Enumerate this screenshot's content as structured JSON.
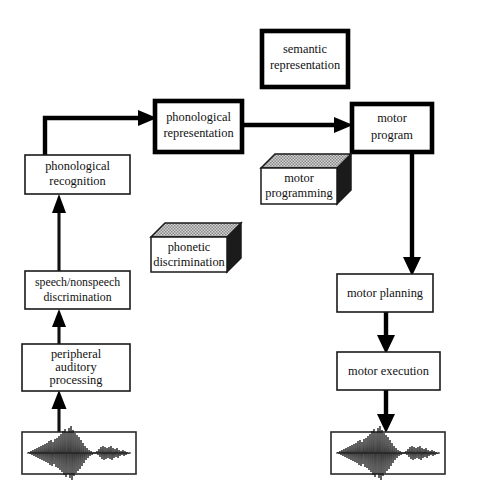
{
  "diagram": {
    "background_color": "#ffffff",
    "line_color": "#000000",
    "box_fill": "#ffffff",
    "cube_side_color": "#1b1b1b",
    "cube_top_color": "#c9c9c9",
    "nodes": [
      {
        "id": "semantic-representation",
        "label_lines": [
          "semantic",
          "representation"
        ],
        "style": "thick-bordered-box",
        "x": 262,
        "y": 31,
        "w": 86,
        "h": 56
      },
      {
        "id": "phonological-representation",
        "label_lines": [
          "phonological",
          "representation"
        ],
        "style": "thick-bordered-box",
        "x": 155,
        "y": 101,
        "w": 87,
        "h": 51
      },
      {
        "id": "motor-program",
        "label_lines": [
          "motor",
          "program"
        ],
        "style": "thick-bordered-box",
        "x": 352,
        "y": 104,
        "w": 80,
        "h": 48
      },
      {
        "id": "phonological-recognition",
        "label_lines": [
          "phonological",
          "recognition"
        ],
        "style": "plain-box",
        "x": 25,
        "y": 155,
        "w": 105,
        "h": 39
      },
      {
        "id": "speech-nonspeech-discrimination",
        "label_lines": [
          "speech/nonspeech",
          "discrimination"
        ],
        "style": "plain-box",
        "x": 25,
        "y": 271,
        "w": 105,
        "h": 38
      },
      {
        "id": "peripheral-auditory-processing",
        "label_lines": [
          "peripheral",
          "auditory",
          "processing"
        ],
        "style": "plain-box",
        "x": 22,
        "y": 344,
        "w": 108,
        "h": 47
      },
      {
        "id": "motor-planning",
        "label_lines": [
          "motor planning"
        ],
        "style": "plain-box",
        "x": 337,
        "y": 274,
        "w": 96,
        "h": 38
      },
      {
        "id": "motor-execution",
        "label_lines": [
          "motor execution"
        ],
        "style": "plain-box",
        "x": 337,
        "y": 352,
        "w": 103,
        "h": 38
      },
      {
        "id": "motor-programming",
        "label_lines": [
          "motor",
          "programming"
        ],
        "style": "cube-3d",
        "x": 261,
        "y": 168,
        "w": 76,
        "h": 36,
        "depth": 14
      },
      {
        "id": "phonetic-discrimination",
        "label_lines": [
          "phonetic",
          "discrimination"
        ],
        "style": "cube-3d",
        "x": 151,
        "y": 237,
        "w": 76,
        "h": 35,
        "depth": 14
      },
      {
        "id": "input-waveform",
        "label_lines": [],
        "style": "waveform-box",
        "x": 22,
        "y": 432,
        "w": 114,
        "h": 42
      },
      {
        "id": "output-waveform",
        "label_lines": [],
        "style": "waveform-box",
        "x": 331,
        "y": 432,
        "w": 114,
        "h": 42
      }
    ],
    "edges": [
      {
        "id": "waveform-to-peripheral",
        "from": "input-waveform",
        "to": "peripheral-auditory-processing",
        "direction": "up",
        "weight": "thin"
      },
      {
        "id": "peripheral-to-speech-nonspeech",
        "from": "peripheral-auditory-processing",
        "to": "speech-nonspeech-discrimination",
        "direction": "up",
        "weight": "thin"
      },
      {
        "id": "speech-nonspeech-to-phonological-recognition",
        "from": "speech-nonspeech-discrimination",
        "to": "phonological-recognition",
        "direction": "up",
        "weight": "thin"
      },
      {
        "id": "phonological-recognition-to-phonological-representation",
        "from": "phonological-recognition",
        "to": "phonological-representation",
        "direction": "up-right",
        "weight": "thick"
      },
      {
        "id": "phonological-representation-to-motor-program",
        "from": "phonological-representation",
        "to": "motor-program",
        "direction": "right",
        "weight": "thick"
      },
      {
        "id": "motor-program-to-motor-planning",
        "from": "motor-program",
        "to": "motor-planning",
        "direction": "down",
        "weight": "thick"
      },
      {
        "id": "motor-planning-to-motor-execution",
        "from": "motor-planning",
        "to": "motor-execution",
        "direction": "down",
        "weight": "thick"
      },
      {
        "id": "motor-execution-to-waveform",
        "from": "motor-execution",
        "to": "output-waveform",
        "direction": "down",
        "weight": "thick"
      }
    ]
  }
}
